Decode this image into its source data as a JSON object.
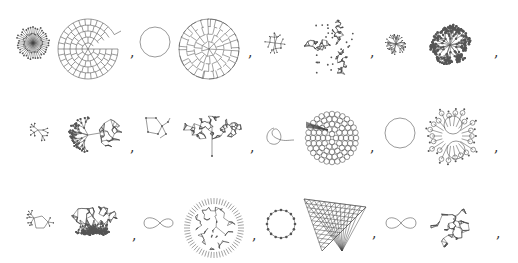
{
  "figure": {
    "layout": "3 rows x 4 pairs of graph drawings, each pair followed by a comma",
    "separator": ",",
    "rows": [
      {
        "pairs": [
          {
            "left": "star-burst",
            "right": "spiral-grid"
          },
          {
            "left": "circle",
            "right": "circular-mesh"
          },
          {
            "left": "small-tree",
            "right": "three-arm-dense"
          },
          {
            "left": "star-tree",
            "right": "branching-cluster"
          }
        ]
      },
      {
        "pairs": [
          {
            "left": "sparse-tree",
            "right": "tree-with-cluster"
          },
          {
            "left": "small-cycle-tree",
            "right": "dense-fan"
          },
          {
            "left": "loop-curve",
            "right": "honeycomb-disc"
          },
          {
            "left": "circle",
            "right": "cactus-disc"
          }
        ]
      },
      {
        "pairs": [
          {
            "left": "small-cycle-tree",
            "right": "dense-tree-fan"
          },
          {
            "left": "figure-eight",
            "right": "spiky-mesh"
          },
          {
            "left": "dotted-ring",
            "right": "triangular-grid"
          },
          {
            "left": "infinity-curve",
            "right": "star-mesh"
          }
        ]
      }
    ]
  }
}
